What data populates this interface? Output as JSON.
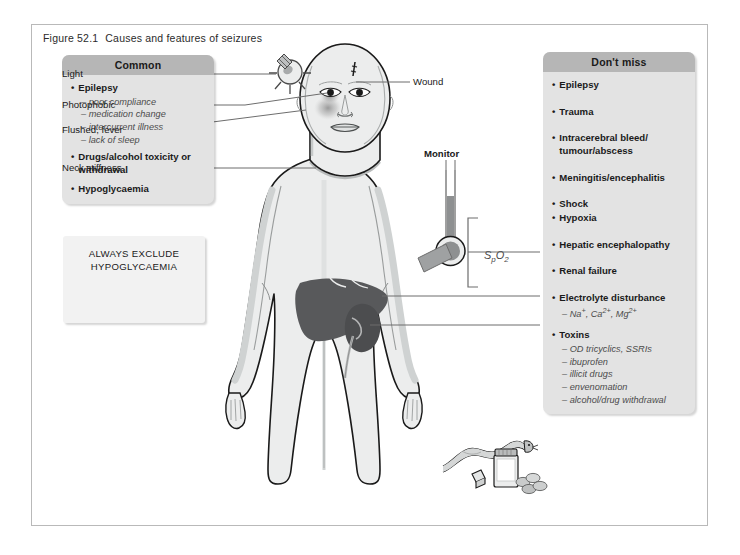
{
  "figure": {
    "number": "Figure 52.1",
    "caption": "Causes and features of seizures"
  },
  "panel_common": {
    "header": "Common",
    "items": [
      {
        "bullet": "•",
        "text": "Epilepsy"
      },
      {
        "sub": "– poor compliance"
      },
      {
        "sub": "– medication change"
      },
      {
        "sub": "– intercurrent illness"
      },
      {
        "sub": "– lack of sleep"
      },
      {
        "bullet": "•",
        "text": "Drugs/alcohol toxicity or withdrawal"
      },
      {
        "bullet": "•",
        "text": "Hypoglycaemia"
      }
    ],
    "b1": "Epilepsy",
    "s1": "– poor compliance",
    "s2": "– medication change",
    "s3": "– intercurrent illness",
    "s4": "– lack of sleep",
    "b2": "Drugs/alcohol toxicity or withdrawal",
    "b3": "Hypoglycaemia",
    "dot": "•"
  },
  "panel_dontmiss": {
    "header": "Don't miss",
    "dot": "•",
    "b1": "Epilepsy",
    "b2": "Trauma",
    "b3": "Intracerebral bleed/ tumour/abscess",
    "b4": "Meningitis/encephalitis",
    "b5": "Shock",
    "b6": "Hypoxia",
    "b7": "Hepatic encephalopathy",
    "b8": "Renal failure",
    "b9": "Electrolyte disturbance",
    "b9_sub_prefix": "– Na",
    "b9_sub_mid": ", Ca",
    "b9_sub_mid2": ", Mg",
    "b10": "Toxins",
    "t1": "– OD tricyclics, SSRIs",
    "t2": "– ibuprofen",
    "t3": "– illicit drugs",
    "t4": "– envenomation",
    "t5": "– alcohol/drug withdrawal"
  },
  "panel_exclude": {
    "line1": "ALWAYS EXCLUDE",
    "line2": "HYPOGLYCAEMIA"
  },
  "figure_labels": {
    "light": "Light",
    "photophobic": "Photophobic",
    "flushed_fever": "Flushed, fever",
    "neck_stiffness": "Neck stiffness",
    "wound": "Wound",
    "monitor": "Monitor",
    "spo2_s": "S",
    "spo2_p": "p",
    "spo2_o": "O",
    "spo2_2": "2"
  },
  "colors": {
    "panel_bg": "#e3e3e3",
    "panel_header_bg": "#b6b6b6",
    "exclude_bg": "#f2f2f2",
    "body_fill": "#eceded",
    "body_shade": "#d6d8d8",
    "organ_dark": "#58595b",
    "organ_kidney": "#4c4d4f",
    "outline": "#1a1a1a",
    "leader": "#6d6d6d",
    "frame": "#b9b9b9",
    "text": "#1a1a1a",
    "sub_text": "#4c4c4c"
  }
}
